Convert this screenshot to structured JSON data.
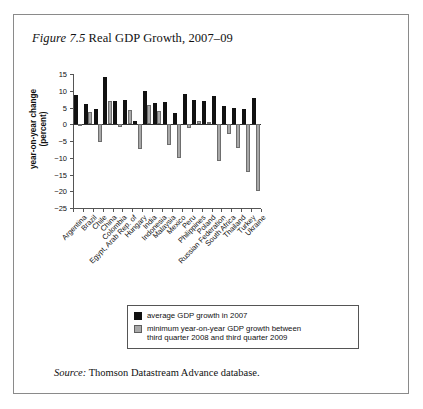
{
  "figure": {
    "number_label": "Figure 7.5",
    "title_text": "Real GDP Growth, 2007–09",
    "source_label": "Source:",
    "source_text": "Thomson Datastream Advance database."
  },
  "legend": {
    "series1_label": "average GDP growth in 2007",
    "series2_label_line1": "minimum year-on-year GDP growth between",
    "series2_label_line2": "third quarter 2008 and third quarter 2009",
    "series1_color": "#111111",
    "series2_color": "#a8a8a8"
  },
  "chart_data": {
    "type": "bar",
    "title": "Real GDP Growth, 2007–09",
    "xlabel": "",
    "ylabel": "year-on-year change (percent)",
    "ylabel_line1": "year-on-year change",
    "ylabel_line2": "(percent)",
    "ylim": [
      -25,
      15
    ],
    "yticks": [
      15,
      10,
      5,
      0,
      -5,
      -10,
      -15,
      -20,
      -25
    ],
    "ytick_labels": [
      "15",
      "10",
      "5",
      "0",
      "−5",
      "−10",
      "−15",
      "−20",
      "−25"
    ],
    "grid": false,
    "legend_position": "below-plot",
    "categories": [
      "Argentina",
      "Brazil",
      "Chile",
      "China",
      "Colombia",
      "Egypt, Arab Rep. of",
      "Hungary",
      "India",
      "Indonesia",
      "Malaysia",
      "Mexico",
      "Peru",
      "Philippines",
      "Poland",
      "Russian Federation",
      "South Africa",
      "Thailand",
      "Turkey",
      "Ukraine"
    ],
    "series": [
      {
        "name": "average GDP growth in 2007",
        "color": "#111111",
        "values": [
          8.7,
          6.1,
          4.6,
          14.2,
          6.9,
          7.1,
          1.0,
          9.8,
          6.3,
          6.5,
          3.3,
          8.9,
          7.1,
          6.8,
          8.5,
          5.5,
          4.9,
          4.7,
          7.9
        ]
      },
      {
        "name": "minimum year-on-year GDP growth between third quarter 2008 and third quarter 2009",
        "color": "#a8a8a8",
        "values": [
          -0.5,
          3.8,
          -5.3,
          6.8,
          -0.9,
          4.3,
          -7.3,
          5.8,
          4.0,
          -6.2,
          -10.0,
          -1.2,
          0.9,
          0.8,
          -11.0,
          -2.8,
          -7.1,
          -14.3,
          -20.0
        ]
      }
    ]
  }
}
